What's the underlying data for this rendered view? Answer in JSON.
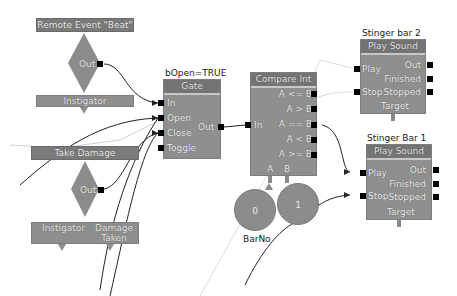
{
  "colors": {
    "node_body": "#8f8f8f",
    "node_title": "#747474",
    "port": "#000000",
    "wire": "#222222",
    "faint_wire": "#d8d8d8",
    "background": "#ffffff"
  },
  "events": [
    {
      "title": "Remote Event \"Beat\"",
      "output": "Out",
      "variable": "Instigator"
    },
    {
      "title": "Take Damage",
      "output": "Out",
      "variables": [
        "Instigator",
        "Damage Taken"
      ]
    }
  ],
  "gate": {
    "caption": "bOpen=TRUE",
    "title": "Gate",
    "inputs": [
      "In",
      "Open",
      "Close",
      "Toggle"
    ],
    "output": "Out"
  },
  "compare": {
    "title": "Compare Int",
    "input": "In",
    "outputs": [
      "A <= B",
      "A > B",
      "A == B",
      "A < B",
      "A >= B"
    ],
    "vars": [
      "A",
      "B"
    ]
  },
  "variables": [
    {
      "value": "0",
      "name": "BarNo"
    },
    {
      "value": "1",
      "name": ""
    }
  ],
  "sounds": [
    {
      "caption": "Stinger bar 2",
      "title": "Play Sound",
      "inputs": [
        "Play",
        "Stop"
      ],
      "outputs": [
        "Out",
        "Finished",
        "Stopped"
      ],
      "var": "Target"
    },
    {
      "caption": "Stinger Bar 1",
      "title": "Play Sound",
      "inputs": [
        "Play",
        "Stop"
      ],
      "outputs": [
        "Out",
        "Finished",
        "Stopped"
      ],
      "var": "Target"
    }
  ]
}
